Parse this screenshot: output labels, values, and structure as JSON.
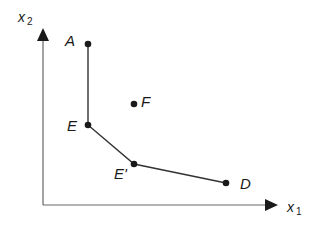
{
  "diagram": {
    "axes": {
      "x_label": "x",
      "x_sub": "1",
      "y_label": "x",
      "y_sub": "2",
      "color": "#555555"
    },
    "points": [
      {
        "id": "A",
        "label": "A",
        "x": 88,
        "y": 44
      },
      {
        "id": "E",
        "label": "E",
        "x": 88,
        "y": 125
      },
      {
        "id": "E_prime",
        "label": "E'",
        "x": 134,
        "y": 164
      },
      {
        "id": "D",
        "label": "D",
        "x": 226,
        "y": 183
      },
      {
        "id": "F",
        "label": "F",
        "x": 134,
        "y": 103
      }
    ],
    "frontier": [
      "A",
      "E",
      "E'",
      "D"
    ],
    "line_color": "#333333",
    "point_color": "#1a1a1a"
  }
}
